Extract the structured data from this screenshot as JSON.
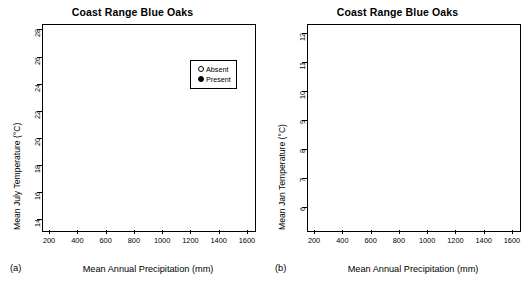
{
  "figure": {
    "panel_a_letter": "(a)",
    "panel_b_letter": "(b)"
  },
  "chart_data": [
    {
      "type": "scatter",
      "panel": "a",
      "title": "Coast Range Blue Oaks",
      "xlabel": "Mean Annual Precipitation (mm)",
      "ylabel": "Mean July Temperature (°C)",
      "xlim": [
        150,
        1650
      ],
      "ylim": [
        13.2,
        28.4
      ],
      "xticks": [
        200,
        400,
        600,
        800,
        1000,
        1200,
        1400,
        1600
      ],
      "yticks": [
        14,
        16,
        18,
        20,
        22,
        24,
        26,
        28
      ],
      "grid": false,
      "legend_position": "top-right",
      "legend": [
        {
          "label": "Absent",
          "marker": "open-circle"
        },
        {
          "label": "Present",
          "marker": "filled-circle"
        }
      ],
      "annotations": [
        {
          "type": "hline",
          "y": 19.7,
          "x_start": 170,
          "x_end": 1640
        }
      ],
      "series": [
        {
          "name": "Present",
          "marker": "filled-circle",
          "color": "#000000",
          "n": 980,
          "x_range": [
            230,
            1380
          ],
          "y_range": [
            14.0,
            28.1
          ],
          "x_center": 520,
          "y_center": 21.6,
          "description": "Dense cluster at low-to-mid precipitation and warm July temperatures; sparse high-temperature tail near 26-28 C at 250-700 mm; thin band of points along y=14 between 950 and 1350 mm"
        },
        {
          "name": "Absent",
          "marker": "open-circle",
          "color": "#000000",
          "n": 720,
          "x_range": [
            250,
            1580
          ],
          "y_range": [
            13.9,
            24.2
          ],
          "x_center": 760,
          "y_center": 18.6,
          "description": "Broad spread skewed to cooler July temperatures and higher precipitation; prominent horizontal band near 14 C from 900-1400 mm and near 16 C from 300-700 mm"
        }
      ]
    },
    {
      "type": "scatter",
      "panel": "b",
      "title": "Coast Range Blue Oaks",
      "xlabel": "Mean Annual Precipitation (mm)",
      "ylabel": "Mean Jan Temperature (°C)",
      "xlim": [
        150,
        1650
      ],
      "ylim": [
        5.2,
        12.3
      ],
      "xticks": [
        200,
        400,
        600,
        800,
        1000,
        1200,
        1400,
        1600
      ],
      "yticks": [
        6,
        7,
        8,
        9,
        10,
        11,
        12
      ],
      "grid": false,
      "legend_position": "none",
      "annotations": [
        {
          "type": "hline",
          "y": 9.15,
          "x_start": 170,
          "x_end": 1350
        }
      ],
      "series": [
        {
          "name": "Present",
          "marker": "filled-circle",
          "color": "#000000",
          "n": 980,
          "x_range": [
            230,
            1380
          ],
          "y_range": [
            5.5,
            11.6
          ],
          "x_center": 520,
          "y_center": 8.1,
          "description": "Very dense mass between 250 and 800 mm centered near 8 C; lower lobe reaching 5.5-6.5 C between 380 and 800 mm including a flat band at about 5.6 C from 480 to 800 mm"
        },
        {
          "name": "Absent",
          "marker": "open-circle",
          "color": "#000000",
          "n": 720,
          "x_range": [
            250,
            1580
          ],
          "y_range": [
            5.7,
            12.1
          ],
          "x_center": 760,
          "y_center": 9.0,
          "description": "Wide vertical plume near 400-600 mm spanning 7 to 12 C; second group at 950-1300 mm around 10-11 C; long tail of points near 8 C extending to 1580 mm"
        }
      ]
    }
  ]
}
